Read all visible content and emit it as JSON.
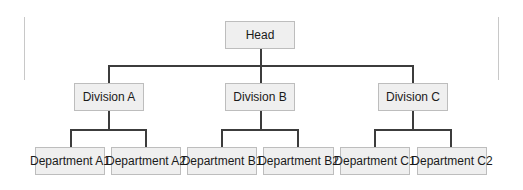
{
  "chart_title": "",
  "colors": {
    "box_fill": "#efefef",
    "box_border": "#bdbdbd",
    "connector": "#3c3c3c",
    "side_rule": "#c8c8c8"
  },
  "org": {
    "head": "Head",
    "divisions": [
      {
        "label": "Division A",
        "departments": [
          "Department A1",
          "Department A2"
        ]
      },
      {
        "label": "Division B",
        "departments": [
          "Department B1",
          "Department B2"
        ]
      },
      {
        "label": "Division C",
        "departments": [
          "Department C1",
          "Department C2"
        ]
      }
    ]
  }
}
